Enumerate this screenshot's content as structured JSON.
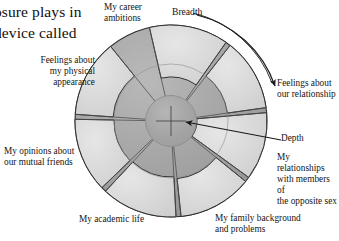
{
  "figure": {
    "type": "social-penetration-wedge-diagram",
    "body_text": "osure plays in\ndevice called",
    "center": {
      "cx": 171,
      "cy": 121,
      "r": 96
    },
    "inner_circle_r": 25,
    "mid_ring_r": 57,
    "colors": {
      "wedge_light": "#d9d9d9",
      "wedge_mid": "#b8b8b8",
      "wedge_dark": "#9a9a9a",
      "core": "#a6a6a6",
      "outline": "#2b2b2b",
      "background": "#ffffff",
      "text": "#141414"
    },
    "axis_labels": {
      "breadth": "Breadth",
      "depth": "Depth"
    },
    "segments": [
      {
        "id": "career",
        "label": "My career\nambitions",
        "start_deg": -103,
        "end_deg": -55,
        "depth_r": 44
      },
      {
        "id": "relationship",
        "label": "Feelings about\nour relationship",
        "start_deg": -52,
        "end_deg": -8,
        "depth_r": 57
      },
      {
        "id": "opposite-sex",
        "label": "My relationships\nwith members of\nthe opposite sex",
        "start_deg": -5,
        "end_deg": 36,
        "depth_r": 26
      },
      {
        "id": "family",
        "label": "My family background\nand problems",
        "start_deg": 39,
        "end_deg": 84,
        "depth_r": 58
      },
      {
        "id": "academic",
        "label": "My academic life",
        "start_deg": 87,
        "end_deg": 133,
        "depth_r": 56
      },
      {
        "id": "mutual-friends",
        "label": "My opinions about\nour mutual friends",
        "start_deg": 136,
        "end_deg": 181,
        "depth_r": 57
      },
      {
        "id": "physical",
        "label": "Feelings about\nmy physical\nappearance",
        "start_deg": 184,
        "end_deg": 231,
        "depth_r": 58
      }
    ]
  }
}
